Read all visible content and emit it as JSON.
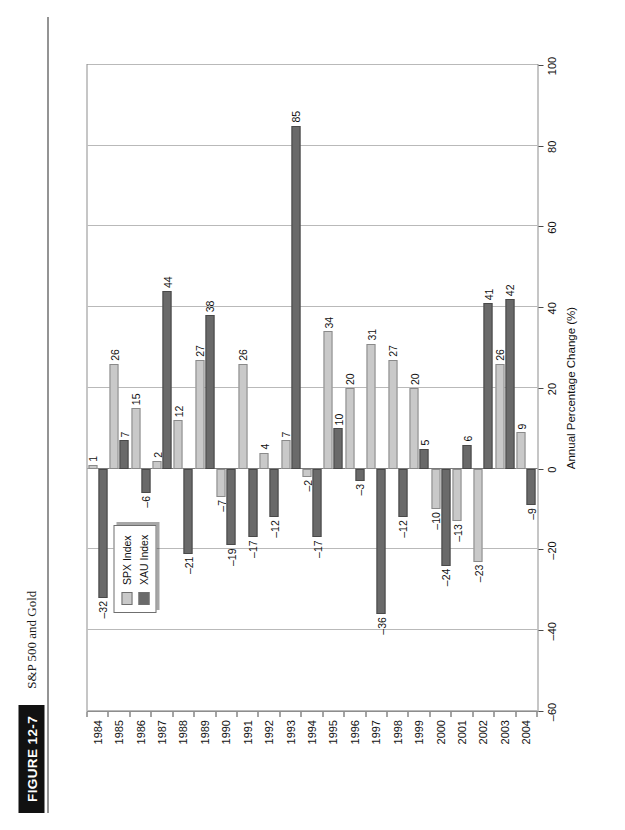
{
  "figure": {
    "badge": "FIGURE 12-7",
    "title": "S&P 500 and Gold"
  },
  "legend": {
    "position": "inside-upper-left",
    "entries": [
      {
        "label": "SPX Index",
        "color": "#c9c9c9"
      },
      {
        "label": "XAU Index",
        "color": "#6a6a6a"
      }
    ]
  },
  "chart_data": {
    "type": "bar",
    "orientation": "horizontal",
    "title": "S&P 500 and Gold",
    "xlabel": "",
    "ylabel": "Annual Percentage Change (%)",
    "ylim": [
      -60,
      100
    ],
    "yticks": [
      -60,
      -40,
      -20,
      0,
      20,
      40,
      60,
      80,
      100
    ],
    "ytick_labels": [
      "–60",
      "–40",
      "–20",
      "0",
      "20",
      "40",
      "60",
      "80",
      "100"
    ],
    "grid": true,
    "legend_position": "inside upper left",
    "categories": [
      "1984",
      "1985",
      "1986",
      "1987",
      "1988",
      "1989",
      "1990",
      "1991",
      "1992",
      "1993",
      "1994",
      "1995",
      "1996",
      "1997",
      "1998",
      "1999",
      "2000",
      "2001",
      "2002",
      "2003",
      "2004"
    ],
    "series": [
      {
        "name": "SPX Index",
        "color": "#c9c9c9",
        "values": [
          1,
          26,
          15,
          2,
          12,
          27,
          -7,
          26,
          4,
          7,
          -2,
          34,
          20,
          31,
          27,
          20,
          -10,
          -13,
          -23,
          26,
          9
        ],
        "labels": [
          "1",
          "26",
          "15",
          "2",
          "12",
          "27",
          "–7",
          "26",
          "4",
          "7",
          "–2",
          "34",
          "20",
          "31",
          "27",
          "20",
          "–10",
          "–13",
          "–23",
          "26",
          "9"
        ]
      },
      {
        "name": "XAU Index",
        "color": "#6a6a6a",
        "values": [
          -32,
          7,
          -6,
          44,
          -21,
          38,
          -19,
          -17,
          -12,
          85,
          -17,
          10,
          -3,
          -36,
          -12,
          5,
          -24,
          6,
          41,
          42,
          -9
        ],
        "labels": [
          "–32",
          "7",
          "–6",
          "44",
          "–21",
          "38",
          "–19",
          "–17",
          "–12",
          "85",
          "–17",
          "10",
          "–3",
          "–36",
          "–12",
          "5",
          "–24",
          "6",
          "41",
          "42",
          "–9"
        ]
      }
    ]
  }
}
